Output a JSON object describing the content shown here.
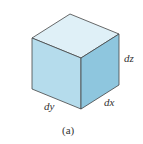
{
  "figure": {
    "caption": "(a)",
    "labels": {
      "dz": "dz",
      "dx": "dx",
      "dy": "dy"
    },
    "colors": {
      "top_face": "#dff0f7",
      "left_face": "#b5dcec",
      "right_face": "#8ec6de",
      "edge": "#444444"
    }
  }
}
